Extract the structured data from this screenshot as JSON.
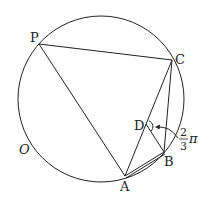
{
  "diagram": {
    "circle": {
      "label": "O",
      "cx": 101,
      "cy": 99,
      "r": 83
    },
    "points": {
      "P": {
        "label": "P",
        "x": 39,
        "y": 44
      },
      "C": {
        "label": "C",
        "x": 172,
        "y": 60
      },
      "A": {
        "label": "A",
        "x": 125,
        "y": 176
      },
      "B": {
        "label": "B",
        "x": 164,
        "y": 152
      },
      "D": {
        "label": "D",
        "x": 146,
        "y": 124
      }
    },
    "segments": [
      "PC",
      "PA",
      "AC",
      "CB",
      "AB",
      "DB"
    ],
    "angle": {
      "vertex": "D",
      "numerator": "2",
      "denominator": "3",
      "symbol": "π"
    },
    "stroke_color": "#222222"
  }
}
